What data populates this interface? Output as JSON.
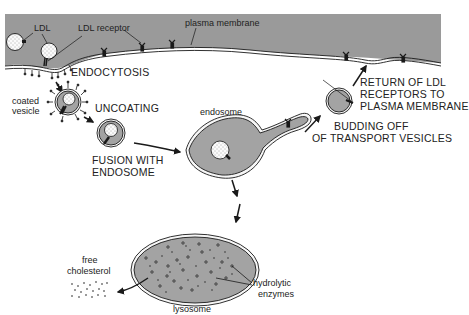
{
  "diagram": {
    "colors": {
      "cytoplasm_gray": "#9a9a9a",
      "organelle_gray": "#a3a3a3",
      "background": "#ffffff",
      "ink": "#1a1a1a"
    },
    "labels": {
      "ldl": "LDL",
      "ldl_receptor": "LDL receptor",
      "plasma_membrane": "plasma membrane",
      "endocytosis": "ENDOCYTOSIS",
      "coated_vesicle_1": "coated",
      "coated_vesicle_2": "vesicle",
      "uncoating": "UNCOATING",
      "fusion_1": "FUSION WITH",
      "fusion_2": "ENDOSOME",
      "endosome": "endosome",
      "budding_1": "BUDDING OFF",
      "budding_2": "OF TRANSPORT VESICLES",
      "return_1": "RETURN OF LDL",
      "return_2": "RECEPTORS TO",
      "return_3": "PLASMA MEMBRANE",
      "free_cholesterol_1": "free",
      "free_cholesterol_2": "cholesterol",
      "hydrolytic_1": "hydrolytic",
      "hydrolytic_2": "enzymes",
      "lysosome": "lysosome"
    }
  }
}
